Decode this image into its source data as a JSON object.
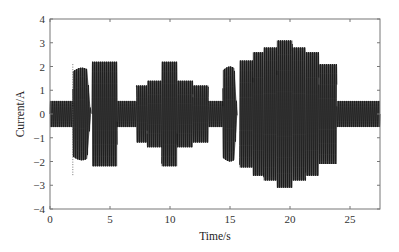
{
  "chart_data": {
    "type": "line",
    "title": "",
    "xlabel": "Time/s",
    "ylabel": "Current/A",
    "xlim": [
      0,
      27.5
    ],
    "ylim": [
      -4,
      4
    ],
    "xticks": [
      0,
      5,
      10,
      15,
      20,
      25
    ],
    "yticks": [
      -4,
      -3,
      -2,
      -1,
      0,
      1,
      2,
      3,
      4
    ],
    "grid": false,
    "legend": null,
    "line_color": "#1a1a1a",
    "series": [
      {
        "name": "Current",
        "envelope_segments": [
          {
            "t_start": 0.0,
            "t_end": 1.9,
            "amplitude": 0.55,
            "shape": "flat"
          },
          {
            "t_start": 1.9,
            "t_end": 3.4,
            "amplitude": 1.95,
            "shape": "spindle"
          },
          {
            "t_start": 3.5,
            "t_end": 5.6,
            "amplitude": 2.2,
            "shape": "flat"
          },
          {
            "t_start": 5.6,
            "t_end": 7.2,
            "amplitude": 0.55,
            "shape": "flat"
          },
          {
            "t_start": 7.2,
            "t_end": 8.1,
            "amplitude": 1.2,
            "shape": "flat"
          },
          {
            "t_start": 8.1,
            "t_end": 9.3,
            "amplitude": 1.4,
            "shape": "flat"
          },
          {
            "t_start": 9.3,
            "t_end": 10.6,
            "amplitude": 2.2,
            "shape": "flat"
          },
          {
            "t_start": 10.6,
            "t_end": 11.9,
            "amplitude": 1.4,
            "shape": "flat"
          },
          {
            "t_start": 11.9,
            "t_end": 13.2,
            "amplitude": 1.2,
            "shape": "flat"
          },
          {
            "t_start": 13.2,
            "t_end": 14.4,
            "amplitude": 0.55,
            "shape": "flat"
          },
          {
            "t_start": 14.4,
            "t_end": 15.6,
            "amplitude": 2.0,
            "shape": "spindle"
          },
          {
            "t_start": 15.8,
            "t_end": 16.9,
            "amplitude": 2.25,
            "shape": "flat"
          },
          {
            "t_start": 16.9,
            "t_end": 17.8,
            "amplitude": 2.6,
            "shape": "flat"
          },
          {
            "t_start": 17.8,
            "t_end": 18.9,
            "amplitude": 2.8,
            "shape": "flat"
          },
          {
            "t_start": 18.9,
            "t_end": 20.2,
            "amplitude": 3.1,
            "shape": "flat"
          },
          {
            "t_start": 20.2,
            "t_end": 21.3,
            "amplitude": 2.8,
            "shape": "flat"
          },
          {
            "t_start": 21.3,
            "t_end": 22.4,
            "amplitude": 2.6,
            "shape": "flat"
          },
          {
            "t_start": 22.4,
            "t_end": 23.9,
            "amplitude": 2.1,
            "shape": "flat"
          },
          {
            "t_start": 23.9,
            "t_end": 27.5,
            "amplitude": 0.55,
            "shape": "flat"
          }
        ]
      }
    ],
    "annotations": [
      {
        "type": "dotted-vertical-line",
        "t": 1.9,
        "y_from": -2.6,
        "y_to": 2.1
      }
    ]
  }
}
